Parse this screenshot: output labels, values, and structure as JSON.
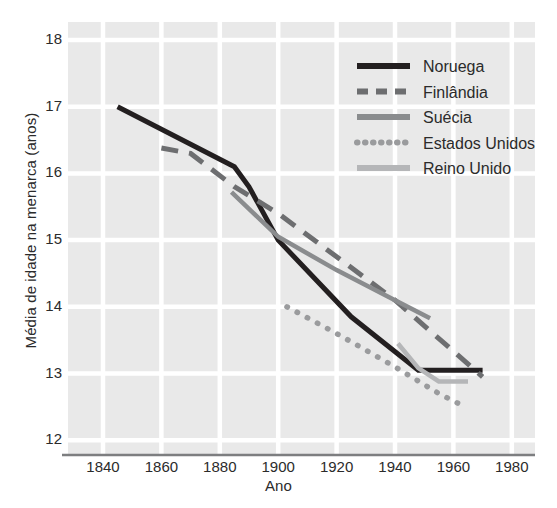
{
  "chart_data": {
    "type": "line",
    "title": "",
    "xlabel": "Ano",
    "ylabel": "Média de idade na menarca (anos)",
    "xlim": [
      1827,
      1981
    ],
    "ylim": [
      11.85,
      18.3
    ],
    "xticks": [
      1840,
      1860,
      1880,
      1900,
      1920,
      1940,
      1960,
      1980
    ],
    "yticks": [
      12,
      13,
      14,
      15,
      16,
      17,
      18
    ],
    "grid": true,
    "legend_position": "top-right",
    "plot_bg": "#e9e9e9",
    "grid_color": "#ffffff",
    "series": [
      {
        "name": "Noruega",
        "style": "solid",
        "color": "#231f20",
        "width": 5.0,
        "points": [
          [
            1845,
            17.0
          ],
          [
            1885,
            16.1
          ],
          [
            1890,
            15.8
          ],
          [
            1900,
            15.0
          ],
          [
            1925,
            13.85
          ],
          [
            1948,
            13.05
          ],
          [
            1970,
            13.05
          ]
        ]
      },
      {
        "name": "Finlândia",
        "style": "dashed",
        "color": "#6d6e70",
        "width": 5.0,
        "points": [
          [
            1860,
            16.38
          ],
          [
            1870,
            16.3
          ],
          [
            1885,
            15.8
          ],
          [
            1900,
            15.4
          ],
          [
            1920,
            14.75
          ],
          [
            1940,
            14.1
          ],
          [
            1970,
            12.95
          ]
        ]
      },
      {
        "name": "Suécia",
        "style": "solid",
        "color": "#8a8c8e",
        "width": 4.5,
        "points": [
          [
            1884,
            15.72
          ],
          [
            1900,
            15.05
          ],
          [
            1920,
            14.55
          ],
          [
            1940,
            14.1
          ],
          [
            1952,
            13.83
          ]
        ]
      },
      {
        "name": "Estados Unidos",
        "style": "dotted",
        "color": "#9a9b9d",
        "width": 5.0,
        "points": [
          [
            1903,
            14.0
          ],
          [
            1920,
            13.6
          ],
          [
            1940,
            13.1
          ],
          [
            1955,
            12.7
          ],
          [
            1964,
            12.5
          ]
        ]
      },
      {
        "name": "Reino Unido",
        "style": "solid",
        "color": "#b5b6b8",
        "width": 4.5,
        "points": [
          [
            1941,
            13.45
          ],
          [
            1948,
            13.08
          ],
          [
            1955,
            12.88
          ],
          [
            1965,
            12.88
          ]
        ]
      }
    ]
  },
  "legend": {
    "items": [
      {
        "label": "Noruega"
      },
      {
        "label": "Finlândia"
      },
      {
        "label": "Suécia"
      },
      {
        "label": "Estados Unidos"
      },
      {
        "label": "Reino Unido"
      }
    ]
  },
  "axes": {
    "x_title": "Ano",
    "y_title": "Média de idade na menarca (anos)",
    "x_tick_labels": [
      "1840",
      "1860",
      "1880",
      "1900",
      "1920",
      "1940",
      "1960",
      "1980"
    ],
    "y_tick_labels": [
      "18",
      "17",
      "16",
      "15",
      "14",
      "13",
      "12"
    ]
  }
}
